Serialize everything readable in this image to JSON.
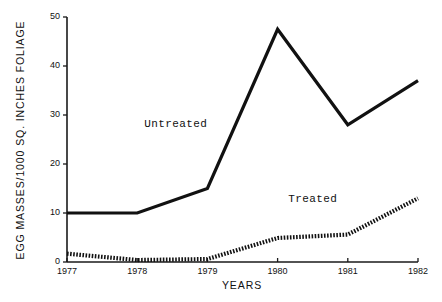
{
  "chart_data": {
    "type": "line",
    "title": "",
    "xlabel": "YEARS",
    "ylabel": "EGG MASSES/1000 SQ. INCHES FOLIAGE",
    "x": [
      1977,
      1978,
      1979,
      1980,
      1981,
      1982
    ],
    "xtick_labels": [
      "1977",
      "1978",
      "1979",
      "1980",
      "1981",
      "1982"
    ],
    "ytick_labels": [
      "0",
      "10",
      "20",
      "30",
      "40",
      "50"
    ],
    "ytick_values": [
      0,
      10,
      20,
      30,
      40,
      50
    ],
    "xlim": [
      1977,
      1982
    ],
    "ylim": [
      0,
      50
    ],
    "grid": false,
    "legend": "inline-annotations",
    "series": [
      {
        "name": "Untreated",
        "style": "solid",
        "values": [
          10,
          10,
          15,
          47.5,
          28,
          37
        ],
        "label": "Untreated",
        "label_x": 1978.1,
        "label_y": 27.5
      },
      {
        "name": "Treated",
        "style": "dotted",
        "values": [
          1.7,
          0.4,
          0.6,
          4.9,
          5.6,
          13
        ],
        "label": "Treated",
        "label_x": 1980.15,
        "label_y": 12.2
      }
    ]
  }
}
